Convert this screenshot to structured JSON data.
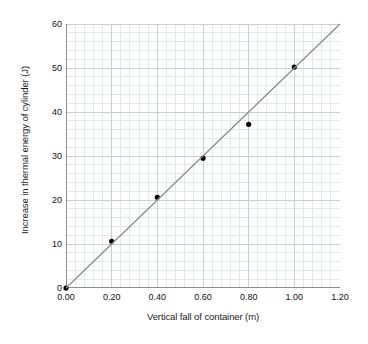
{
  "chart_data": {
    "type": "scatter",
    "title": "",
    "xlabel": "Vertical fall of container (m)",
    "ylabel": "Increase in thermal energy of cylinder (J)",
    "xlim": [
      0,
      1.2
    ],
    "ylim": [
      0,
      60
    ],
    "xticks": [
      "0.00",
      "0.20",
      "0.40",
      "0.60",
      "0.80",
      "1.00",
      "1.20"
    ],
    "xtick_values": [
      0,
      0.2,
      0.4,
      0.6,
      0.8,
      1.0,
      1.2
    ],
    "yticks": [
      "0",
      "10",
      "20",
      "30",
      "40",
      "50",
      "60"
    ],
    "ytick_values": [
      0,
      10,
      20,
      30,
      40,
      50,
      60
    ],
    "grid": true,
    "grid_minor": true,
    "grid_minor_divisions_x": 5,
    "grid_minor_divisions_y": 5,
    "legend": false,
    "series": [
      {
        "name": "Measured points",
        "marker": "filled-circle",
        "marker_color": "#000000",
        "marker_size": 4.0,
        "x": [
          0.0,
          0.2,
          0.4,
          0.6,
          0.8,
          1.0
        ],
        "y": [
          0.0,
          10.6,
          20.6,
          29.5,
          37.2,
          50.2
        ]
      },
      {
        "name": "Line of best fit",
        "type": "line",
        "color": "#8c8c8c",
        "width": 1.3,
        "x": [
          0.0,
          1.2
        ],
        "y": [
          0.0,
          60.0
        ]
      }
    ],
    "colors": {
      "marker": "#000000",
      "trendline": "#8c8c8c",
      "grid_major": "#c9cdd6",
      "grid_minor": "#e4e7ee",
      "axis": "#8e8e8e",
      "text": "#1b1b1b",
      "background": "#ffffff"
    }
  }
}
